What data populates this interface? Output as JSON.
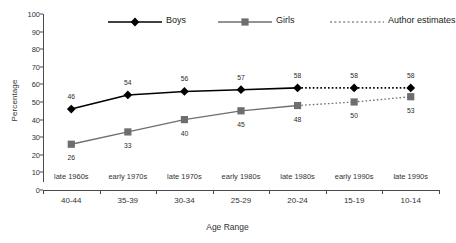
{
  "chart_data": {
    "type": "line",
    "title": "",
    "xlabel": "Age Range",
    "ylabel": "Percentage",
    "ylim": [
      0,
      100
    ],
    "yticks": [
      100,
      90,
      80,
      70,
      60,
      50,
      40,
      30,
      20,
      10,
      0
    ],
    "grid": false,
    "legend_position": "top",
    "categories": [
      "40-44",
      "35-39",
      "30-34",
      "25-29",
      "20-24",
      "15-19",
      "10-14"
    ],
    "secondary_categories": [
      "late 1960s",
      "early 1970s",
      "late 1970s",
      "early 1980s",
      "late 1980s",
      "early 1990s",
      "late 1990s"
    ],
    "estimate_start_index": 4,
    "series": [
      {
        "name": "Boys",
        "color": "#000000",
        "marker": "diamond",
        "values": [
          46,
          54,
          56,
          57,
          58,
          58,
          58
        ],
        "label_positions": [
          "above",
          "above",
          "above",
          "above",
          "above",
          "above",
          "above"
        ]
      },
      {
        "name": "Girls",
        "color": "#6e6e6e",
        "marker": "square",
        "values": [
          26,
          33,
          40,
          45,
          48,
          50,
          53
        ],
        "label_positions": [
          "below",
          "below",
          "below",
          "below",
          "below",
          "below",
          "below"
        ]
      }
    ],
    "legend": [
      {
        "label": "Boys",
        "style": "solid-diamond",
        "color": "#000000"
      },
      {
        "label": "Girls",
        "style": "solid-square",
        "color": "#6e6e6e"
      },
      {
        "label": "Author estimates",
        "style": "dashed-line",
        "color": "#555555"
      }
    ]
  }
}
